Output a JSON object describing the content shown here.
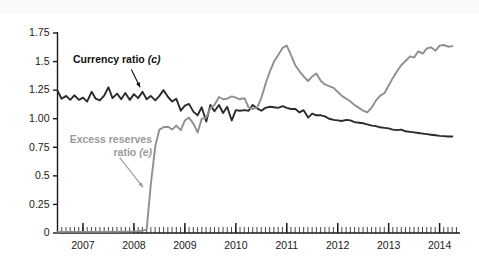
{
  "chart_data": {
    "type": "line",
    "title": "",
    "xlabel": "",
    "ylabel": "",
    "xlim": [
      2006.5,
      2014.4
    ],
    "ylim": [
      0,
      1.75
    ],
    "yticks": [
      "0",
      "0.25",
      "0.5",
      "0.75",
      "1.00",
      "1.25",
      "1.5",
      "1.75"
    ],
    "ytick_values": [
      0,
      0.25,
      0.5,
      0.75,
      1.0,
      1.25,
      1.5,
      1.75
    ],
    "xticks": [
      "2007",
      "2008",
      "2009",
      "2010",
      "2011",
      "2012",
      "2013",
      "2014"
    ],
    "xtick_values": [
      2007,
      2008,
      2009,
      2010,
      2011,
      2012,
      2013,
      2014
    ],
    "minor_tick_interval_years": 0.0833,
    "grid": false,
    "legend_position": "inline-annotations",
    "series": [
      {
        "name": "Currency ratio (c)",
        "label_plain": "Currency ratio",
        "label_symbol": "(c)",
        "color": "#2b2b2b",
        "x": [
          2006.5,
          2006.58,
          2006.67,
          2006.75,
          2006.83,
          2006.92,
          2007.0,
          2007.08,
          2007.17,
          2007.25,
          2007.33,
          2007.42,
          2007.5,
          2007.58,
          2007.67,
          2007.75,
          2007.83,
          2007.92,
          2008.0,
          2008.08,
          2008.17,
          2008.25,
          2008.33,
          2008.42,
          2008.5,
          2008.58,
          2008.67,
          2008.75,
          2008.83,
          2008.92,
          2009.0,
          2009.08,
          2009.17,
          2009.25,
          2009.33,
          2009.42,
          2009.5,
          2009.58,
          2009.67,
          2009.75,
          2009.83,
          2009.92,
          2010.0,
          2010.08,
          2010.17,
          2010.25,
          2010.33,
          2010.42,
          2010.5,
          2010.58,
          2010.67,
          2010.75,
          2010.83,
          2010.92,
          2011.0,
          2011.08,
          2011.17,
          2011.25,
          2011.33,
          2011.42,
          2011.5,
          2011.58,
          2011.67,
          2011.75,
          2011.83,
          2011.92,
          2012.0,
          2012.08,
          2012.17,
          2012.25,
          2012.33,
          2012.42,
          2012.5,
          2012.58,
          2012.67,
          2012.75,
          2012.83,
          2012.92,
          2013.0,
          2013.08,
          2013.17,
          2013.25,
          2013.33,
          2013.42,
          2013.5,
          2013.58,
          2013.67,
          2013.75,
          2013.83,
          2013.92,
          2014.0,
          2014.08,
          2014.17,
          2014.25
        ],
        "y": [
          1.245,
          1.175,
          1.2,
          1.165,
          1.205,
          1.165,
          1.185,
          1.15,
          1.235,
          1.175,
          1.16,
          1.205,
          1.275,
          1.18,
          1.22,
          1.17,
          1.225,
          1.165,
          1.215,
          1.18,
          1.235,
          1.17,
          1.2,
          1.16,
          1.2,
          1.25,
          1.19,
          1.15,
          1.175,
          1.07,
          1.115,
          1.13,
          1.06,
          1.03,
          1.1,
          0.975,
          1.12,
          1.065,
          1.12,
          1.05,
          1.105,
          0.985,
          1.075,
          1.07,
          1.075,
          1.07,
          1.12,
          1.09,
          1.07,
          1.095,
          1.105,
          1.1,
          1.095,
          1.11,
          1.095,
          1.085,
          1.085,
          1.055,
          1.075,
          1.01,
          1.045,
          1.03,
          1.03,
          1.02,
          1.0,
          0.99,
          0.985,
          0.98,
          0.99,
          0.985,
          0.97,
          0.965,
          0.96,
          0.95,
          0.94,
          0.935,
          0.925,
          0.92,
          0.915,
          0.905,
          0.9,
          0.905,
          0.89,
          0.885,
          0.88,
          0.875,
          0.87,
          0.865,
          0.86,
          0.855,
          0.85,
          0.848,
          0.845,
          0.845
        ]
      },
      {
        "name": "Excess reserves ratio (e)",
        "label_plain_line1": "Excess reserves",
        "label_plain_line2": "ratio",
        "label_symbol": "(e)",
        "color": "#8f8f8f",
        "x": [
          2006.5,
          2006.75,
          2007.0,
          2007.25,
          2007.5,
          2007.75,
          2008.0,
          2008.08,
          2008.17,
          2008.25,
          2008.33,
          2008.42,
          2008.5,
          2008.58,
          2008.67,
          2008.75,
          2008.83,
          2008.92,
          2009.0,
          2009.08,
          2009.17,
          2009.25,
          2009.33,
          2009.42,
          2009.5,
          2009.58,
          2009.67,
          2009.75,
          2009.83,
          2009.92,
          2010.0,
          2010.08,
          2010.17,
          2010.25,
          2010.33,
          2010.42,
          2010.5,
          2010.58,
          2010.67,
          2010.75,
          2010.83,
          2010.92,
          2011.0,
          2011.08,
          2011.17,
          2011.25,
          2011.33,
          2011.42,
          2011.5,
          2011.58,
          2011.67,
          2011.75,
          2011.83,
          2011.92,
          2012.0,
          2012.08,
          2012.17,
          2012.25,
          2012.33,
          2012.42,
          2012.5,
          2012.58,
          2012.67,
          2012.75,
          2012.83,
          2012.92,
          2013.0,
          2013.08,
          2013.17,
          2013.25,
          2013.33,
          2013.42,
          2013.5,
          2013.58,
          2013.67,
          2013.75,
          2013.83,
          2013.92,
          2014.0,
          2014.08,
          2014.17,
          2014.25
        ],
        "y": [
          0.01,
          0.01,
          0.01,
          0.01,
          0.01,
          0.012,
          0.014,
          0.016,
          0.02,
          0.03,
          0.42,
          0.76,
          0.905,
          0.925,
          0.93,
          0.905,
          0.94,
          0.9,
          0.985,
          1.01,
          0.955,
          0.88,
          1.0,
          1.01,
          1.095,
          1.12,
          1.19,
          1.17,
          1.175,
          1.195,
          1.185,
          1.17,
          1.18,
          1.1,
          1.085,
          1.1,
          1.18,
          1.3,
          1.415,
          1.5,
          1.555,
          1.62,
          1.64,
          1.56,
          1.465,
          1.415,
          1.37,
          1.33,
          1.37,
          1.395,
          1.33,
          1.3,
          1.285,
          1.27,
          1.235,
          1.2,
          1.175,
          1.15,
          1.12,
          1.095,
          1.07,
          1.055,
          1.1,
          1.16,
          1.2,
          1.225,
          1.29,
          1.355,
          1.42,
          1.47,
          1.505,
          1.545,
          1.535,
          1.59,
          1.57,
          1.615,
          1.625,
          1.595,
          1.64,
          1.645,
          1.63,
          1.635
        ]
      }
    ],
    "annotations": [
      {
        "text": "Currency ratio (c)",
        "series": "Currency ratio (c)",
        "arrow_from_x": 2007.95,
        "arrow_from_y": 1.43,
        "arrow_to_x": 2008.12,
        "arrow_to_y": 1.275
      },
      {
        "text": "Excess reserves ratio (e)",
        "series": "Excess reserves ratio (e)",
        "arrow_from_x": 2007.72,
        "arrow_from_y": 0.66,
        "arrow_to_x": 2008.18,
        "arrow_to_y": 0.4
      }
    ]
  },
  "colors": {
    "currency_line": "#2b2b2b",
    "reserves_line": "#8f8f8f",
    "axis": "#1a1a1a",
    "background": "#ffffff",
    "top_band": "#fafafa"
  }
}
